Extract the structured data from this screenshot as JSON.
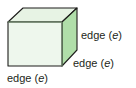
{
  "figure": {
    "background_color": "#ffffff",
    "solid": {
      "name": "cube",
      "front_face_color": "#eef7ed",
      "top_face_color": "#e3f2e0",
      "side_face_color": "#b0dea9",
      "outline_color": "#1d1d1b",
      "inner_edge_color": "#7d9b78"
    },
    "labels": [
      {
        "id": "right",
        "text": "edge (",
        "variable": "e",
        "close": ")"
      },
      {
        "id": "middle",
        "text": "edge (",
        "variable": "e",
        "close": ")"
      },
      {
        "id": "bottom",
        "text": "edge (",
        "variable": "e",
        "close": ")"
      }
    ]
  }
}
